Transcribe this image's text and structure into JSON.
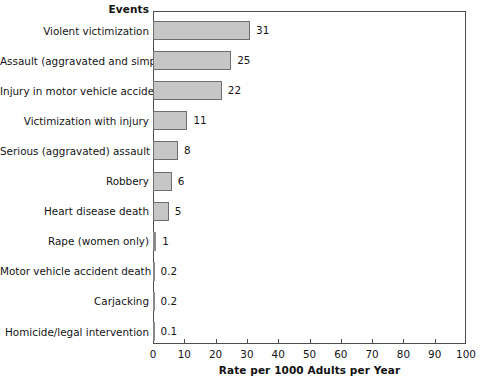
{
  "chart_data": {
    "type": "bar",
    "orientation": "horizontal",
    "title": "",
    "column_header": "Events",
    "xlabel": "Rate per 1000 Adults per Year",
    "ylabel": "",
    "xlim": [
      0,
      100
    ],
    "xticks": [
      0,
      10,
      20,
      30,
      40,
      50,
      60,
      70,
      80,
      90,
      100
    ],
    "xtick_labels": [
      "0",
      "10",
      "20",
      "30",
      "40",
      "50",
      "60",
      "70",
      "80",
      "90",
      "100"
    ],
    "grid": false,
    "legend": "none",
    "categories": [
      "Violent victimization",
      "Assault (aggravated and simple)",
      "Injury in motor vehicle accident",
      "Victimization with injury",
      "Serious (aggravated) assault",
      "Robbery",
      "Heart disease death",
      "Rape (women only)",
      "Motor vehicle accident death",
      "Carjacking",
      "Homicide/legal intervention"
    ],
    "values": [
      31,
      25,
      22,
      11,
      8,
      6,
      5,
      1,
      0.2,
      0.2,
      0.1
    ],
    "value_labels": [
      "31",
      "25",
      "22",
      "11",
      "8",
      "6",
      "5",
      "1",
      "0.2",
      "0.2",
      "0.1"
    ],
    "bar_fill_color": "#c6c6c6",
    "bar_edge_color": "#6e6e6e",
    "frame_color": "#4d4d4d",
    "background_color": "#ffffff"
  }
}
